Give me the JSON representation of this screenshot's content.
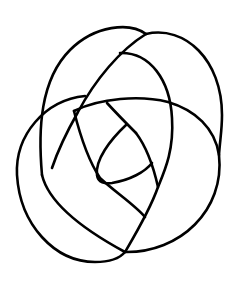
{
  "diagram": {
    "type": "knot-diagram",
    "background": "#ffffff",
    "stroke_color": "#000000"
  }
}
